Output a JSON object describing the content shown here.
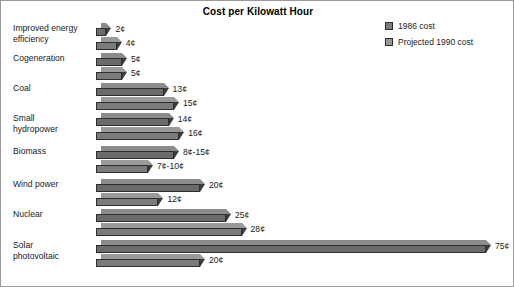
{
  "chart_data": {
    "type": "bar",
    "title": "Cost per Kilowatt Hour",
    "xlabel": "",
    "ylabel": "",
    "orientation": "horizontal",
    "grid": false,
    "legend_position": "top-right",
    "unit": "¢",
    "xlim": [
      0,
      75
    ],
    "categories": [
      "Improved energy efficiency",
      "Cogeneration",
      "Coal",
      "Small hydropower",
      "Biomass",
      "Wind power",
      "Nuclear",
      "Solar photovoltaic"
    ],
    "series": [
      {
        "name": "1986 cost",
        "color": "#808080",
        "values": [
          2,
          5,
          13,
          14,
          15,
          20,
          25,
          75
        ],
        "labels": [
          "2¢",
          "5¢",
          "13¢",
          "14¢",
          "8¢-15¢",
          "20¢",
          "25¢",
          "75¢"
        ]
      },
      {
        "name": "Projected 1990 cost",
        "color": "#909090",
        "values": [
          4,
          5,
          15,
          16,
          10,
          12,
          28,
          20
        ],
        "labels": [
          "4¢",
          "5¢",
          "15¢",
          "16¢",
          "7¢-10¢",
          "12¢",
          "28¢",
          "20¢"
        ]
      }
    ]
  },
  "legend": {
    "items": [
      {
        "label": "1986 cost",
        "color": "#7d7d7d"
      },
      {
        "label": "Projected 1990 cost",
        "color": "#989898"
      }
    ]
  },
  "rows": [
    {
      "label": "Improved energy\nefficiency",
      "bars": [
        {
          "value": 2,
          "label": "2¢",
          "series": "1986 cost"
        },
        {
          "value": 4,
          "label": "4¢",
          "series": "Projected 1990 cost"
        }
      ]
    },
    {
      "label": "Cogeneration",
      "bars": [
        {
          "value": 5,
          "label": "5¢",
          "series": "1986 cost"
        },
        {
          "value": 5,
          "label": "5¢",
          "series": "Projected 1990 cost"
        }
      ]
    },
    {
      "label": "Coal",
      "bars": [
        {
          "value": 13,
          "label": "13¢",
          "series": "1986 cost"
        },
        {
          "value": 15,
          "label": "15¢",
          "series": "Projected 1990 cost"
        }
      ]
    },
    {
      "label": "Small\nhydropower",
      "bars": [
        {
          "value": 14,
          "label": "14¢",
          "series": "1986 cost"
        },
        {
          "value": 16,
          "label": "16¢",
          "series": "Projected 1990 cost"
        }
      ]
    },
    {
      "label": "Biomass",
      "bars": [
        {
          "value": 15,
          "label": "8¢-15¢",
          "series": "1986 cost"
        },
        {
          "value": 10,
          "label": "7¢-10¢",
          "series": "Projected 1990 cost"
        }
      ]
    },
    {
      "label": "Wind power",
      "bars": [
        {
          "value": 20,
          "label": "20¢",
          "series": "1986 cost"
        },
        {
          "value": 12,
          "label": "12¢",
          "series": "Projected 1990 cost"
        }
      ]
    },
    {
      "label": "Nuclear",
      "bars": [
        {
          "value": 25,
          "label": "25¢",
          "series": "1986 cost"
        },
        {
          "value": 28,
          "label": "28¢",
          "series": "Projected 1990 cost"
        }
      ]
    },
    {
      "label": "Solar\nphotovoltaic",
      "bars": [
        {
          "value": 75,
          "label": "75¢",
          "series": "1986 cost"
        },
        {
          "value": 20,
          "label": "20¢",
          "series": "Projected 1990 cost"
        }
      ]
    }
  ],
  "layout": {
    "bar_scale_px_per_cent": 5.2,
    "bar_min_px": 9,
    "bar_height_px": 8,
    "bar_depth_px": 5,
    "row_pitch_px": [
      30,
      30,
      30,
      33,
      33,
      30,
      31,
      32
    ],
    "bars_left_px": 95,
    "rows_top_px": 22
  }
}
